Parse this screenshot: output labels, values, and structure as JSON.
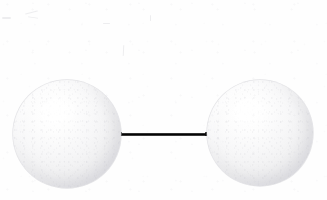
{
  "figure": {
    "kind": "molecular-model",
    "caption": "",
    "background_color": "#fefefe",
    "width": 327,
    "height": 200
  },
  "molecule": {
    "name": "diatomic-molecule",
    "atom_count": 2,
    "bond_count": 1,
    "bond_order_label": "",
    "atoms": [
      {
        "id": "atom-left",
        "label": "",
        "element_symbol": "",
        "center_x": 67,
        "center_y": 134,
        "radius": 54,
        "fill_color": "#f3f3f5",
        "highlight_color": "#ffffff",
        "shadow_color": "#dcdce1",
        "rim_color": "#cecdd4"
      },
      {
        "id": "atom-right",
        "label": "",
        "element_symbol": "",
        "center_x": 260,
        "center_y": 133,
        "radius": 53,
        "fill_color": "#f3f3f5",
        "highlight_color": "#ffffff",
        "shadow_color": "#dcdce1",
        "rim_color": "#cecdd4"
      }
    ],
    "bond": {
      "id": "bond-1",
      "label": "",
      "x_start": 118,
      "x_end": 209,
      "center_y": 134,
      "thickness": 3,
      "color": "#0c0c0c",
      "highlight_color": "#6e6e6e"
    }
  },
  "annotations": {
    "title": "",
    "labels": [],
    "scan_artifacts_visible": true
  }
}
